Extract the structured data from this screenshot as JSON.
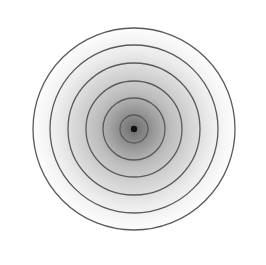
{
  "figure": {
    "type": "concentric-circles",
    "center": [
      134,
      129
    ],
    "ring_radii": [
      14,
      31,
      48,
      66,
      84,
      101
    ],
    "ring_color": "#5a5a5a",
    "ring_width": 1.3,
    "center_dot": {
      "radius": 3.2,
      "color": "#111111"
    },
    "gradient": {
      "inner_color": "#6e6e6e",
      "mid_color": "#bdbdbd",
      "outer_color": "#ffffff",
      "radius": 104
    },
    "background": "#ffffff"
  }
}
